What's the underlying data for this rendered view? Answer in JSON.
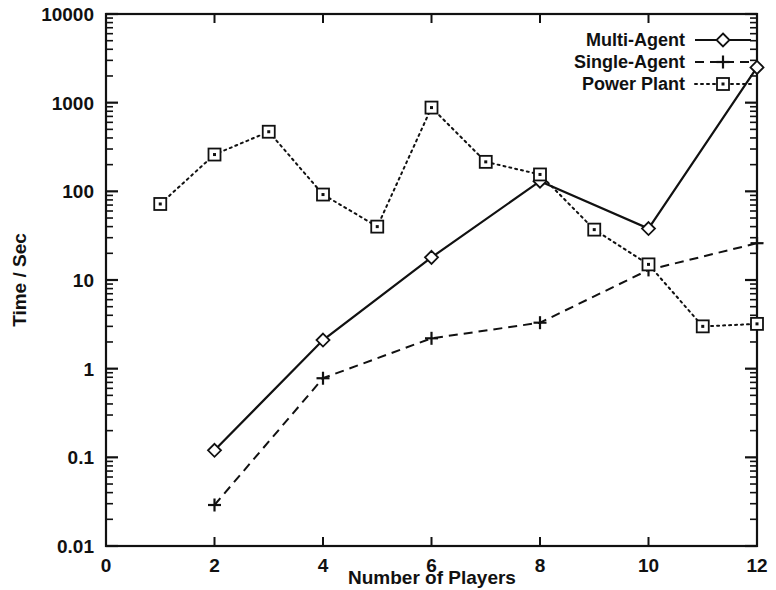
{
  "chart_data": {
    "type": "line",
    "title": "",
    "xlabel": "Number of Players",
    "ylabel": "Time / Sec",
    "xlim": [
      0,
      12
    ],
    "ylim": [
      0.01,
      10000
    ],
    "yscale": "log",
    "xscale": "linear",
    "grid": false,
    "legend_position": "top-right",
    "xticks": [
      "0",
      "2",
      "4",
      "6",
      "8",
      "10",
      "12"
    ],
    "xtick_values": [
      0,
      2,
      4,
      6,
      8,
      10,
      12
    ],
    "yticks": [
      "0.01",
      "0.1",
      "1",
      "10",
      "100",
      "1000",
      "10000"
    ],
    "ytick_values": [
      0.01,
      0.1,
      1,
      10,
      100,
      1000,
      10000
    ],
    "series": [
      {
        "name": "Multi-Agent",
        "marker": "diamond",
        "line_style": "solid",
        "color": "#111111",
        "x": [
          2,
          4,
          6,
          8,
          10,
          12
        ],
        "values": [
          0.12,
          2.1,
          18,
          130,
          38,
          2500
        ]
      },
      {
        "name": "Single-Agent",
        "marker": "plus",
        "line_style": "dashed",
        "color": "#111111",
        "x": [
          2,
          4,
          6,
          8,
          10,
          12
        ],
        "values": [
          0.029,
          0.78,
          2.2,
          3.3,
          13,
          26
        ]
      },
      {
        "name": "Power Plant",
        "marker": "square",
        "line_style": "dotted",
        "color": "#111111",
        "x": [
          1,
          2,
          3,
          4,
          5,
          6,
          7,
          8,
          9,
          10,
          11,
          12
        ],
        "values": [
          72,
          260,
          470,
          92,
          40,
          880,
          215,
          155,
          37,
          15,
          3.0,
          3.2
        ]
      }
    ]
  },
  "legend": {
    "entries": [
      {
        "label": "Multi-Agent"
      },
      {
        "label": "Single-Agent"
      },
      {
        "label": "Power Plant"
      }
    ]
  },
  "axes": {
    "x_title": "Number of Players",
    "y_title": "Time / Sec"
  },
  "colors": {
    "ink": "#111111",
    "background": "#ffffff"
  }
}
